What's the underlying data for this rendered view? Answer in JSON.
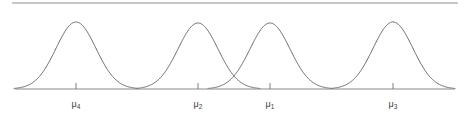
{
  "figure": {
    "kind": "statistics-figure",
    "width": 467,
    "height": 127,
    "background_color": "#ffffff",
    "top_rule": {
      "visible": true,
      "y": 3,
      "x_start": 12,
      "x_end": 458,
      "color": "#8f8f8f"
    }
  },
  "axis": {
    "y": 89,
    "x_start": 15,
    "x_end": 455,
    "color": "#8a8a8a",
    "tick_length": 6,
    "tick_color": "#6e6e6e",
    "label_color": "#3b3b3b",
    "label_y": 107
  },
  "curve_style": {
    "stroke_color": "#585858",
    "stroke_width": 0.9,
    "fill": "none"
  },
  "chart_data": {
    "type": "line",
    "title": "",
    "subtitle": "",
    "xlabel": "",
    "ylabel": "",
    "grid": false,
    "legend": null,
    "xlim": [
      15,
      455
    ],
    "ylim": [
      0,
      1
    ],
    "axis_baseline_y": 89,
    "peak_y": 22,
    "note": "Four bell-shaped normal density curves of equal height and equal spread, drawn over a single horizontal axis. Tick marks sit beneath each curve peak and are labelled with population means in non-sequential order.",
    "series": [
      {
        "name": "mu_4",
        "label": "μ₄",
        "label_base": "μ",
        "label_sub": "4",
        "mean_x": 76,
        "peak_y": 22,
        "sigma_px": 20,
        "half_width_px": 62,
        "amplitude": 1.0
      },
      {
        "name": "mu_2",
        "label": "μ₂",
        "label_base": "μ",
        "label_sub": "2",
        "mean_x": 198,
        "peak_y": 23,
        "sigma_px": 20,
        "half_width_px": 62,
        "amplitude": 1.0
      },
      {
        "name": "mu_1",
        "label": "μ₁",
        "label_base": "μ",
        "label_sub": "1",
        "mean_x": 270,
        "peak_y": 23,
        "sigma_px": 20,
        "half_width_px": 62,
        "amplitude": 1.0
      },
      {
        "name": "mu_3",
        "label": "μ₃",
        "label_base": "μ",
        "label_sub": "3",
        "mean_x": 393,
        "peak_y": 22,
        "sigma_px": 20,
        "half_width_px": 62,
        "amplitude": 1.0
      }
    ],
    "ticks": [
      {
        "x": 76,
        "label": "μ₄",
        "label_base": "μ",
        "label_sub": "4"
      },
      {
        "x": 198,
        "label": "μ₂",
        "label_base": "μ",
        "label_sub": "2"
      },
      {
        "x": 270,
        "label": "μ₁",
        "label_base": "μ",
        "label_sub": "1"
      },
      {
        "x": 393,
        "label": "μ₃",
        "label_base": "μ",
        "label_sub": "3"
      }
    ],
    "crossings": [
      {
        "between": [
          "mu_2",
          "mu_1"
        ],
        "x": 235,
        "y": 70
      }
    ]
  }
}
